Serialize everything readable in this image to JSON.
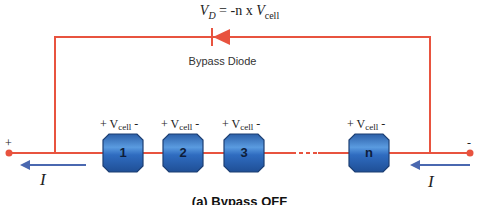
{
  "equation": {
    "lhs_symbol": "V",
    "lhs_sub": "D",
    "rhs_text": " = -n x ",
    "rhs_symbol": "V",
    "rhs_sub": "cell"
  },
  "diode": {
    "label": "Bypass Diode",
    "icon": "diode-symbol-pointing-left"
  },
  "terminals": {
    "positive": "+",
    "negative": "-"
  },
  "cells": [
    {
      "label": "1",
      "voltage_prefix": "+ V",
      "voltage_sub": "cell",
      "voltage_suffix": " -"
    },
    {
      "label": "2",
      "voltage_prefix": "+ V",
      "voltage_sub": "cell",
      "voltage_suffix": " -"
    },
    {
      "label": "3",
      "voltage_prefix": "+ V",
      "voltage_sub": "cell",
      "voltage_suffix": " -"
    },
    {
      "label": "n",
      "voltage_prefix": "+ V",
      "voltage_sub": "cell",
      "voltage_suffix": " -"
    }
  ],
  "current": {
    "left_label": "I",
    "right_label": "I"
  },
  "caption": "(a) Bypass OFF",
  "colors": {
    "wire": "#e8533f",
    "cell_fill": "#3a78c9",
    "cell_border": "#1d3f73",
    "arrow": "#4a68b0",
    "text": "#222222"
  }
}
